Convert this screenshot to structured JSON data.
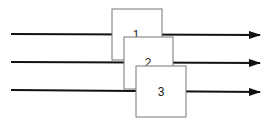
{
  "diagram": {
    "lines": [
      {
        "id": "line-1",
        "y": 34
      },
      {
        "id": "line-2",
        "y": 62
      },
      {
        "id": "line-3",
        "y": 91
      }
    ],
    "boxes": [
      {
        "id": "box-1",
        "label": "1"
      },
      {
        "id": "box-2",
        "label": "2"
      },
      {
        "id": "box-3",
        "label": "3"
      }
    ],
    "colors": {
      "line": "#111111",
      "box_border": "#777777",
      "box_fill": "#ffffff"
    }
  }
}
